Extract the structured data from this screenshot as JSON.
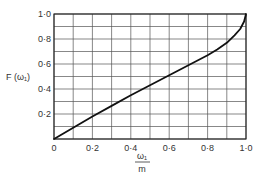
{
  "chart_data": {
    "type": "line",
    "title": "",
    "xlabel": "ω1 / m",
    "xlabel_numerator": "ω₁",
    "xlabel_denominator": "m",
    "ylabel": "F (ω₁)",
    "xlim": [
      0,
      1.0
    ],
    "ylim": [
      0,
      1.0
    ],
    "grid": true,
    "x_ticks": [
      0,
      0.1,
      0.2,
      0.3,
      0.4,
      0.5,
      0.6,
      0.7,
      0.8,
      0.9,
      1.0
    ],
    "y_ticks": [
      0,
      0.1,
      0.2,
      0.3,
      0.4,
      0.5,
      0.6,
      0.7,
      0.8,
      0.9,
      1.0
    ],
    "x_tick_labels": [
      {
        "value": 0,
        "label": "0"
      },
      {
        "value": 0.2,
        "label": "0·2"
      },
      {
        "value": 0.4,
        "label": "0·4"
      },
      {
        "value": 0.6,
        "label": "0·6"
      },
      {
        "value": 0.8,
        "label": "0·8"
      },
      {
        "value": 1.0,
        "label": "1·0"
      }
    ],
    "y_tick_labels": [
      {
        "value": 0.2,
        "label": "0·2"
      },
      {
        "value": 0.4,
        "label": "0·4"
      },
      {
        "value": 0.6,
        "label": "0·6"
      },
      {
        "value": 0.8,
        "label": "0·8"
      },
      {
        "value": 1.0,
        "label": "1·0"
      }
    ],
    "series": [
      {
        "name": "F(ω1)",
        "x": [
          0,
          0.1,
          0.2,
          0.3,
          0.4,
          0.5,
          0.6,
          0.7,
          0.8,
          0.85,
          0.9,
          0.94,
          0.97,
          0.99,
          1.0
        ],
        "y": [
          0,
          0.09,
          0.18,
          0.265,
          0.35,
          0.43,
          0.51,
          0.59,
          0.67,
          0.715,
          0.77,
          0.83,
          0.88,
          0.94,
          1.0
        ]
      }
    ],
    "legend": null
  },
  "layout": {
    "plot_left": 54,
    "plot_top": 14,
    "plot_right": 246,
    "plot_bottom": 139
  },
  "colors": {
    "curve": "#111111",
    "grid": "#555555",
    "text": "#333333"
  }
}
